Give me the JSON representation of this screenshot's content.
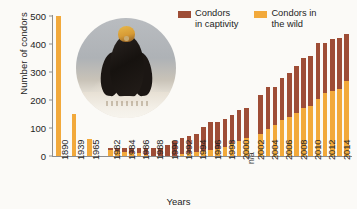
{
  "chart_data": {
    "type": "bar",
    "title": "",
    "subtitle": "",
    "xlabel": "Years",
    "ylabel": "Number of condors",
    "ylim": [
      0,
      500
    ],
    "yticks": [
      0,
      100,
      200,
      300,
      400,
      500
    ],
    "grid": false,
    "stacked": true,
    "legend_position": "top-right",
    "categories": [
      "1890",
      "1939",
      "1965",
      "1982",
      "1983",
      "1984",
      "1985",
      "1986",
      "1987",
      "1988",
      "1989",
      "1990",
      "1991",
      "1992",
      "1993",
      "1994",
      "1995",
      "1996",
      "1997",
      "1998",
      "1999",
      "2000",
      "2001",
      "2002",
      "2003",
      "2004",
      "2005",
      "2006",
      "2007",
      "2008",
      "2009",
      "2010",
      "2011",
      "2012",
      "2013",
      "2014",
      "2015"
    ],
    "series": [
      {
        "name": "Condors in the wild",
        "color": "#f2a93b",
        "values": [
          500,
          150,
          60,
          22,
          19,
          15,
          12,
          9,
          3,
          0,
          0,
          0,
          0,
          8,
          9,
          14,
          17,
          21,
          25,
          32,
          45,
          52,
          66,
          null,
          80,
          95,
          110,
          127,
          140,
          155,
          172,
          180,
          205,
          225,
          231,
          240,
          268
        ]
      },
      {
        "name": "Condors in captivity",
        "color": "#9e4d36",
        "values": [
          0,
          0,
          0,
          5,
          8,
          12,
          15,
          18,
          24,
          27,
          27,
          40,
          52,
          55,
          61,
          66,
          86,
          100,
          96,
          102,
          100,
          112,
          105,
          null,
          138,
          152,
          138,
          150,
          155,
          165,
          178,
          178,
          198,
          180,
          187,
          182,
          167
        ]
      }
    ],
    "annotations": [
      {
        "text": "n/a",
        "category": "2002",
        "rotation": -90
      }
    ],
    "visible_xtick_labels": [
      "1890",
      "1939",
      "1965",
      "1982",
      "1984",
      "1986",
      "1988",
      "1990",
      "1992",
      "1994",
      "1996",
      "1998",
      "2000",
      "2002",
      "2004",
      "2006",
      "2008",
      "2010",
      "2012",
      "2014"
    ]
  },
  "axes": {
    "y_title": "Number of condors",
    "x_title": "Years",
    "y_ticks": [
      "500",
      "400",
      "300",
      "200",
      "100",
      "0"
    ]
  },
  "legend": {
    "items": [
      {
        "label": "Condors\nin captivity",
        "color": "#9e4d36",
        "name": "condors-in-captivity"
      },
      {
        "label": "Condors in\nthe wild",
        "color": "#f2a93b",
        "name": "condors-in-the-wild"
      }
    ]
  },
  "annotation": {
    "na_text": "n/a"
  },
  "photo": {
    "alt": "california-condor-photograph"
  }
}
